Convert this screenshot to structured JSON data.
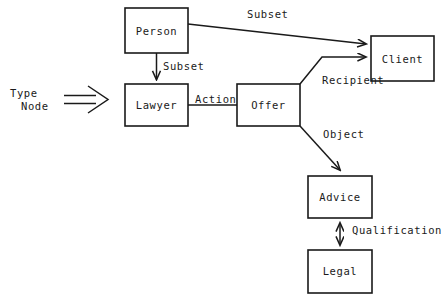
{
  "diagram": {
    "background_color": "#ffffff",
    "line_color": "#1a1a1a",
    "legend": {
      "label_line1": "Type",
      "label_line2": "Node",
      "arrow_icon": "double-line-arrow-right"
    },
    "nodes": [
      {
        "id": "person",
        "label": "Person",
        "x": 125,
        "y": 8,
        "w": 63,
        "h": 45
      },
      {
        "id": "client",
        "label": "Client",
        "x": 371,
        "y": 36,
        "w": 63,
        "h": 45
      },
      {
        "id": "lawyer",
        "label": "Lawyer",
        "x": 125,
        "y": 84,
        "w": 63,
        "h": 42
      },
      {
        "id": "offer",
        "label": "Offer",
        "x": 237,
        "y": 84,
        "w": 63,
        "h": 42
      },
      {
        "id": "advice",
        "label": "Advice",
        "x": 308,
        "y": 176,
        "w": 64,
        "h": 42
      },
      {
        "id": "legal",
        "label": "Legal",
        "x": 308,
        "y": 250,
        "w": 64,
        "h": 43
      }
    ],
    "edges": [
      {
        "id": "person-client",
        "label": "Subset",
        "from": "person",
        "to": "client",
        "arrow": "single",
        "label_x": 247,
        "label_y": 14
      },
      {
        "id": "person-lawyer",
        "label": "Subset",
        "from": "person",
        "to": "lawyer",
        "arrow": "single",
        "label_x": 163,
        "label_y": 66
      },
      {
        "id": "lawyer-offer",
        "label": "Action",
        "from": "lawyer",
        "to": "offer",
        "arrow": "none",
        "label_x": 195,
        "label_y": 100
      },
      {
        "id": "offer-client",
        "label": "Recipient",
        "from": "offer",
        "to": "client",
        "arrow": "single",
        "label_x": 322,
        "label_y": 78
      },
      {
        "id": "offer-advice",
        "label": "Object",
        "from": "offer",
        "to": "advice",
        "arrow": "single",
        "label_x": 323,
        "label_y": 133
      },
      {
        "id": "advice-legal",
        "label": "Qualification",
        "from": "advice",
        "to": "legal",
        "arrow": "double",
        "label_x": 352,
        "label_y": 229
      }
    ]
  }
}
